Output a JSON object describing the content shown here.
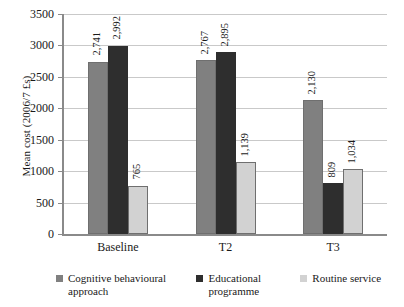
{
  "chart_data": {
    "type": "bar",
    "title": "",
    "subtitle": "",
    "xlabel": "",
    "ylabel": "Mean cost (2006/7 £s)",
    "categories": [
      "Baseline",
      "T2",
      "T3"
    ],
    "series": [
      {
        "name": "Cognitive behavioural approach",
        "color": "#808080",
        "values": [
          2741,
          2767,
          2130
        ],
        "labels": [
          "2,741",
          "2,767",
          "2,130"
        ]
      },
      {
        "name": "Educational programme",
        "color": "#2e2e2e",
        "values": [
          2992,
          2895,
          809
        ],
        "labels": [
          "2,992",
          "2,895",
          "809"
        ]
      },
      {
        "name": "Routine service",
        "color": "#d2d2d2",
        "values": [
          765,
          1139,
          1034
        ],
        "labels": [
          "765",
          "1,139",
          "1,034"
        ]
      }
    ],
    "grouped_values": {
      "Baseline": {
        "cognitive_behavioural_approach": 2741,
        "educational_programme": 2767,
        "routine_service": 2130
      },
      "T2": {
        "cognitive_behavioural_approach": 2992,
        "educational_programme": 2895,
        "routine_service": 809
      },
      "T3": {
        "cognitive_behavioural_approach": 765,
        "educational_programme": 1139,
        "routine_service": 1034
      }
    },
    "ylim": [
      0,
      3500
    ],
    "ytick_step": 500,
    "ytick_labels": [
      "3500",
      "3000",
      "2500",
      "2000",
      "1500",
      "1000",
      "500",
      "0"
    ],
    "grid": "horizontal",
    "legend_position": "bottom"
  },
  "axis": {
    "y_title": "Mean cost (2006/7 £s)"
  },
  "legend": {
    "items": [
      {
        "label_line1": "Cognitive behavioural",
        "label_line2": "approach",
        "color": "#808080"
      },
      {
        "label_line1": "Educational",
        "label_line2": "programme",
        "color": "#2e2e2e"
      },
      {
        "label_line1": "Routine service",
        "label_line2": "",
        "color": "#d2d2d2"
      }
    ]
  }
}
